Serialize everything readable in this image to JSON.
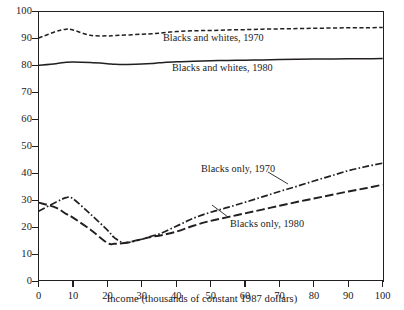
{
  "chart_data": {
    "type": "line",
    "title": "",
    "xlabel": "Income (thousands of constant 1987 dollars)",
    "ylabel": "",
    "xlim": [
      0,
      100
    ],
    "ylim": [
      0,
      100
    ],
    "xticks": [
      0,
      10,
      20,
      30,
      40,
      50,
      60,
      70,
      80,
      90,
      100
    ],
    "yticks": [
      0,
      10,
      20,
      30,
      40,
      50,
      60,
      70,
      80,
      90,
      100
    ],
    "grid": false,
    "legend_position": "inline-annotations",
    "x": [
      0,
      5,
      8,
      10,
      15,
      20,
      22,
      25,
      30,
      33,
      35,
      40,
      45,
      50,
      55,
      60,
      65,
      70,
      75,
      80,
      85,
      90,
      95,
      100
    ],
    "series": [
      {
        "name": "Blacks and whites, 1970",
        "style": "dashed",
        "color": "#231f20",
        "values": [
          90.2,
          92.6,
          93.5,
          93.2,
          91.2,
          91.0,
          91.1,
          91.3,
          91.6,
          91.8,
          92.0,
          92.6,
          92.9,
          93.0,
          93.2,
          93.3,
          93.5,
          93.6,
          93.7,
          93.8,
          93.9,
          94.0,
          94.0,
          94.1
        ]
      },
      {
        "name": "Blacks and whites, 1980",
        "style": "solid",
        "color": "#231f20",
        "values": [
          80.1,
          80.7,
          81.2,
          81.3,
          81.1,
          80.7,
          80.5,
          80.4,
          80.6,
          80.8,
          81.0,
          81.4,
          81.6,
          81.8,
          81.9,
          82.0,
          82.1,
          82.2,
          82.3,
          82.4,
          82.4,
          82.5,
          82.5,
          82.6
        ]
      },
      {
        "name": "Blacks only, 1970",
        "style": "dash-dot",
        "color": "#231f20",
        "values": [
          26.0,
          29.3,
          31.0,
          30.6,
          25.0,
          19.0,
          16.2,
          14.3,
          15.6,
          16.8,
          17.5,
          20.4,
          23.4,
          25.6,
          27.4,
          29.3,
          31.3,
          33.3,
          35.2,
          37.2,
          39.1,
          41.0,
          42.5,
          43.8
        ]
      },
      {
        "name": "Blacks only, 1980",
        "style": "long-dash",
        "color": "#231f20",
        "values": [
          29.2,
          27.3,
          25.0,
          23.6,
          19.2,
          14.2,
          13.9,
          14.2,
          15.6,
          16.6,
          16.9,
          18.4,
          20.6,
          22.4,
          23.8,
          25.2,
          26.6,
          28.0,
          29.4,
          30.7,
          32.0,
          33.3,
          34.5,
          35.8
        ]
      }
    ]
  },
  "axis": {
    "x_title": "Income (thousands of constant 1987 dollars)",
    "x_tick_labels": [
      "0",
      "10",
      "20",
      "30",
      "40",
      "50",
      "60",
      "70",
      "80",
      "90",
      "100"
    ],
    "y_tick_labels": [
      "0",
      "10",
      "20",
      "30",
      "40",
      "50",
      "60",
      "70",
      "80",
      "90",
      "100"
    ]
  },
  "annotations": {
    "blacks_whites_1970": "Blacks and whites, 1970",
    "blacks_whites_1980": "Blacks and whites, 1980",
    "blacks_only_1970": "Blacks only, 1970",
    "blacks_only_1980": "Blacks only, 1980"
  }
}
